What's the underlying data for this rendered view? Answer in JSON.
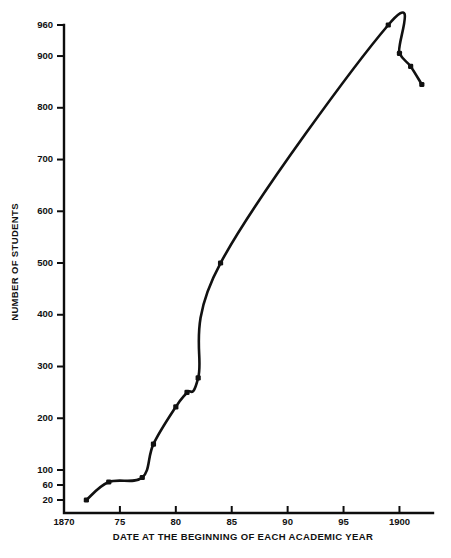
{
  "chart_data": {
    "type": "line",
    "title": "",
    "subtitle": "",
    "xlabel": "DATE AT THE BEGINNING OF EACH ACADEMIC YEAR",
    "ylabel": "NUMBER OF STUDENTS",
    "grid": false,
    "legend": "none",
    "xlim": [
      1870,
      1903
    ],
    "ylim": [
      20,
      960
    ],
    "y_axis_note": "broken/compressed scale below 100",
    "xtick_values": [
      1870,
      1875,
      1880,
      1885,
      1890,
      1895,
      1900
    ],
    "xtick_labels": [
      "1870",
      "75",
      "80",
      "85",
      "90",
      "95",
      "1900"
    ],
    "ytick_values": [
      20,
      60,
      100,
      200,
      300,
      400,
      500,
      600,
      700,
      800,
      900,
      960
    ],
    "ytick_labels": [
      "20",
      "60",
      "100",
      "200",
      "300",
      "400",
      "500",
      "600",
      "700",
      "800",
      "900",
      "960"
    ],
    "x": [
      1872,
      1874,
      1877,
      1878,
      1880,
      1881,
      1882,
      1884,
      1899,
      1900,
      1901,
      1902
    ],
    "values": [
      20,
      68,
      80,
      150,
      222,
      250,
      278,
      500,
      960,
      905,
      880,
      845
    ],
    "series": [
      {
        "name": "Number of students",
        "x": [
          1872,
          1874,
          1877,
          1878,
          1880,
          1881,
          1882,
          1884,
          1899,
          1900,
          1901,
          1902
        ],
        "values": [
          20,
          68,
          80,
          150,
          222,
          250,
          278,
          500,
          960,
          905,
          880,
          845
        ]
      }
    ],
    "annotations": []
  }
}
